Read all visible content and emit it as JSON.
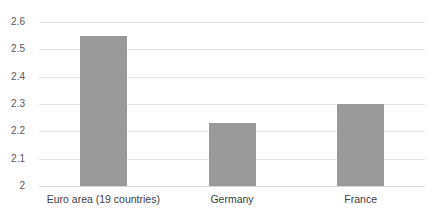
{
  "chart_data": {
    "type": "bar",
    "title": "",
    "subtitle": "",
    "xlabel": "",
    "ylabel": "",
    "categories": [
      "Euro area (19 countries)",
      "Germany",
      "France"
    ],
    "values": [
      2.55,
      2.23,
      2.3
    ],
    "series": [
      {
        "name": "",
        "values": [
          2.55,
          2.23,
          2.3
        ]
      }
    ],
    "ylim": [
      2,
      2.6
    ],
    "ytick_labels": [
      "2",
      "2.1",
      "2.2",
      "2.3",
      "2.4",
      "2.5",
      "2.6"
    ],
    "ytick_values": [
      2,
      2.1,
      2.2,
      2.3,
      2.4,
      2.5,
      2.6
    ],
    "grid": true,
    "grid_axis": "y",
    "legend": false,
    "legend_position": "none",
    "annotations": [],
    "colors": {
      "bar": "#9a9a9a",
      "gridline": "#e3e3e3",
      "baseline": "#d9d9d9",
      "tick_label": "#595959",
      "category_label": "#404040",
      "background": "#ffffff"
    }
  }
}
